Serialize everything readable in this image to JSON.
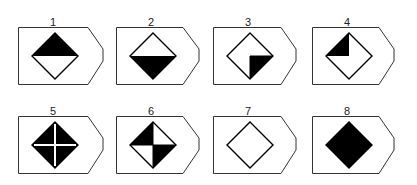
{
  "figures": [
    {
      "label": "1",
      "fill": "top-half"
    },
    {
      "label": "2",
      "fill": "bottom-half"
    },
    {
      "label": "3",
      "fill": "bottom-right-quarter"
    },
    {
      "label": "4",
      "fill": "top-left-quarter"
    },
    {
      "label": "5",
      "fill": "full-with-white-cross"
    },
    {
      "label": "6",
      "fill": "top-left-and-bottom-right-quarters"
    },
    {
      "label": "7",
      "fill": "none"
    },
    {
      "label": "8",
      "fill": "full"
    }
  ],
  "colors": {
    "ink": "#000000",
    "line": "#333333",
    "background": "#ffffff"
  }
}
